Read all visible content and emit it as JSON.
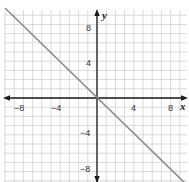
{
  "chart_data": {
    "type": "line",
    "title": "",
    "xlabel": "x",
    "ylabel": "y",
    "xlim": [
      -10,
      9.7
    ],
    "ylim": [
      -9.1,
      9.6
    ],
    "grid": true,
    "grid_step": 1,
    "x_ticks": [
      -8,
      -4,
      4,
      8
    ],
    "y_ticks": [
      8,
      4,
      -4,
      -8
    ],
    "x_tick_labels": [
      "−8",
      "−4",
      "4",
      "8"
    ],
    "y_tick_labels": [
      "8",
      "4",
      "−4",
      "−8"
    ],
    "axes_arrows": "both ends",
    "series": [
      {
        "name": "y = -x",
        "equation": "y = -x",
        "x": [
          -10,
          0,
          9.7
        ],
        "y": [
          10,
          0,
          -9.7
        ],
        "color": "#808080"
      }
    ],
    "legend": null
  },
  "colors": {
    "grid": "#cfcfcf",
    "axis": "#1a1a1a",
    "line": "#8a8a8a",
    "background": "#ffffff"
  },
  "labels": {
    "x_axis": "x",
    "y_axis": "y",
    "xt_n8": "−8",
    "xt_n4": "−4",
    "xt_4": "4",
    "xt_8": "8",
    "yt_8": "8",
    "yt_4": "4",
    "yt_n4": "−4",
    "yt_n8": "−8"
  }
}
